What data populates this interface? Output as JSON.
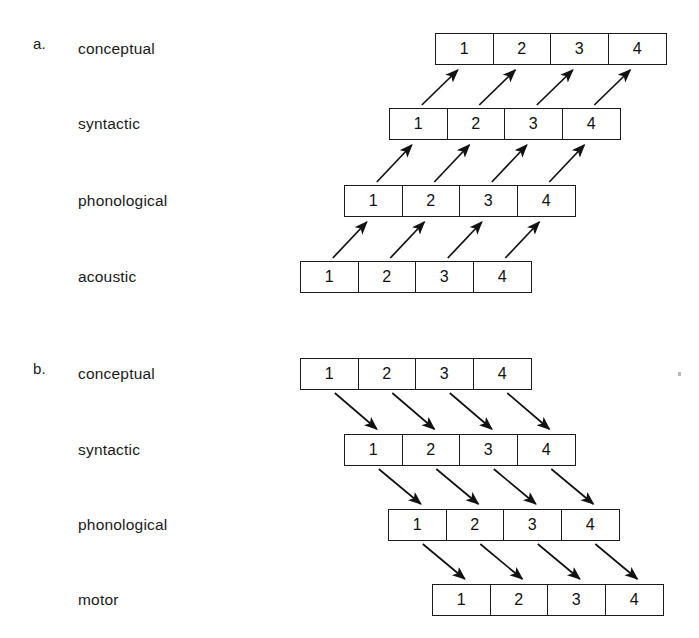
{
  "figure": {
    "background": "#ffffff",
    "line_color": "#1b1b1b",
    "text_color": "#1a1a1a",
    "cell_values": [
      "1",
      "2",
      "3",
      "4"
    ]
  },
  "panels": [
    {
      "letter": "a.",
      "direction": "upward",
      "arrow_direction_label": "up-right",
      "rows": [
        {
          "label": "conceptual",
          "cells": [
            "1",
            "2",
            "3",
            "4"
          ],
          "x": 435,
          "y": 33
        },
        {
          "label": "syntactic",
          "cells": [
            "1",
            "2",
            "3",
            "4"
          ],
          "x": 389,
          "y": 108
        },
        {
          "label": "phonological",
          "cells": [
            "1",
            "2",
            "3",
            "4"
          ],
          "x": 344,
          "y": 185
        },
        {
          "label": "acoustic",
          "cells": [
            "1",
            "2",
            "3",
            "4"
          ],
          "x": 300,
          "y": 261
        }
      ]
    },
    {
      "letter": "b.",
      "direction": "downward",
      "arrow_direction_label": "down-right",
      "rows": [
        {
          "label": "conceptual",
          "cells": [
            "1",
            "2",
            "3",
            "4"
          ],
          "x": 300,
          "y": 358
        },
        {
          "label": "syntactic",
          "cells": [
            "1",
            "2",
            "3",
            "4"
          ],
          "x": 344,
          "y": 434
        },
        {
          "label": "phonological",
          "cells": [
            "1",
            "2",
            "3",
            "4"
          ],
          "x": 388,
          "y": 509
        },
        {
          "label": "motor",
          "cells": [
            "1",
            "2",
            "3",
            "4"
          ],
          "x": 432,
          "y": 584
        }
      ]
    }
  ]
}
